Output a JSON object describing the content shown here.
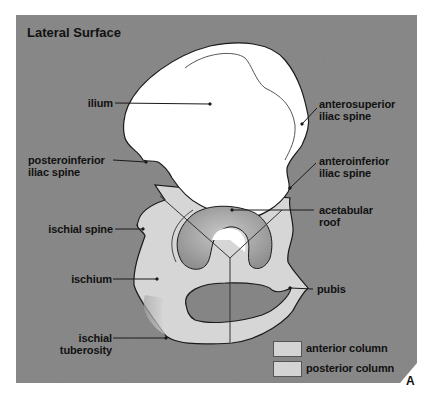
{
  "figure": {
    "title": "Lateral Surface",
    "panel_letter": "A",
    "colors": {
      "background_panel": "#858585",
      "ilium_fill": "#ffffff",
      "column_fill": "#d6d6d6",
      "outline": "#1a1a1a"
    }
  },
  "labels": {
    "ilium": "ilium",
    "posteroinferior_1": "posteroinferior",
    "posteroinferior_2": "iliac spine",
    "anterosuperior_1": "anterosuperior",
    "anterosuperior_2": "iliac spine",
    "anteroinferior_1": "anteroinferior",
    "anteroinferior_2": "iliac spine",
    "acetabular_1": "acetabular",
    "acetabular_2": "roof",
    "ischial_spine": "ischial spine",
    "ischium": "ischium",
    "pubis": "pubis",
    "ischial_tub_1": "ischial",
    "ischial_tub_2": "tuberosity"
  },
  "legend": {
    "items": [
      {
        "label": "anterior column"
      },
      {
        "label": "posterior column"
      }
    ]
  }
}
